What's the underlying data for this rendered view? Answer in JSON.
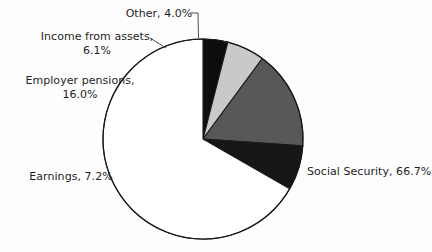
{
  "chart_data": {
    "type": "pie",
    "title": "",
    "subtitle": "",
    "xlabel": "",
    "ylabel": "",
    "legend_position": "none",
    "grid": false,
    "units": "percent",
    "center": {
      "x": 203,
      "y": 139
    },
    "radius": 100,
    "start_angle_deg": 90,
    "direction": "counterclockwise",
    "categories": [
      "Other",
      "Income from assets",
      "Employer pensions",
      "Earnings",
      "Social Security"
    ],
    "values": [
      4.0,
      6.1,
      16.0,
      7.2,
      66.7
    ],
    "colors": [
      "#0d0d0d",
      "#c9c9c9",
      "#585858",
      "#161616",
      "#ffffff"
    ],
    "slices": [
      {
        "label": "Other",
        "value": 4.0,
        "display": "Other, 4.0%",
        "color": "#0d0d0d",
        "outline": "#1a1a1a"
      },
      {
        "label": "Income from assets",
        "value": 6.1,
        "display": "Income from assets, 6.1%",
        "color": "#c9c9c9",
        "outline": "#1a1a1a"
      },
      {
        "label": "Employer pensions",
        "value": 16.0,
        "display": "Employer pensions, 16.0%",
        "color": "#585858",
        "outline": "#1a1a1a"
      },
      {
        "label": "Earnings",
        "value": 7.2,
        "display": "Earnings, 7.2%",
        "color": "#161616",
        "outline": "#1a1a1a"
      },
      {
        "label": "Social Security",
        "value": 66.7,
        "display": "Social Security, 66.7%",
        "color": "#ffffff",
        "outline": "#1a1a1a"
      }
    ]
  },
  "labels": {
    "other": "Other, 4.0%",
    "income_line1": "Income from assets,",
    "income_line2": "6.1%",
    "pensions_line1": "Employer pensions,",
    "pensions_line2": "16.0%",
    "earnings": "Earnings, 7.2%",
    "social_security": "Social Security, 66.7%"
  },
  "style": {
    "background": "#fdfdfd",
    "text_color": "#1f1f1f",
    "outline_color": "#1a1a1a"
  }
}
